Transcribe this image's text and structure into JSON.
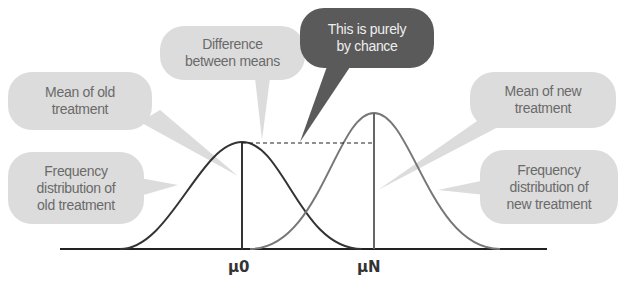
{
  "callouts": {
    "difference": "Difference between means",
    "difference_l1": "Difference",
    "difference_l2": "between means",
    "chance_l1": "This is purely",
    "chance_l2": "by chance",
    "mean_old_l1": "Mean of old",
    "mean_old_l2": "treatment",
    "mean_new_l1": "Mean of new",
    "mean_new_l2": "treatment",
    "freq_old_l1": "Frequency",
    "freq_old_l2": "distribution of",
    "freq_old_l3": "old treatment",
    "freq_new_l1": "Frequency",
    "freq_new_l2": "distribution of",
    "freq_new_l3": "new treatment"
  },
  "axis_labels": {
    "mu_old": "μ0",
    "mu_new": "μN"
  },
  "colors": {
    "light_bubble": "#dcdcdc",
    "dark_bubble": "#5a5a5a",
    "old_curve": "#333333",
    "new_curve": "#777777"
  }
}
